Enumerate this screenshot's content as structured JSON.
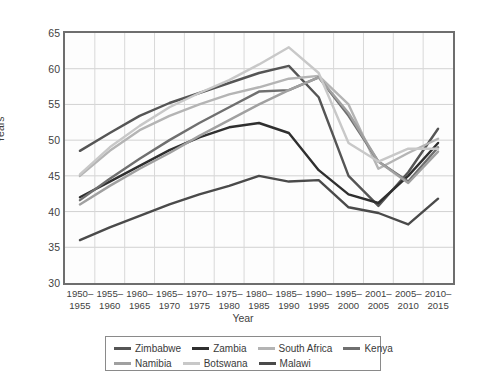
{
  "chart_data": {
    "type": "line",
    "title": "",
    "xlabel": "Year",
    "ylabel": "Years",
    "ylim": [
      30,
      65
    ],
    "yticks": [
      30,
      35,
      40,
      45,
      50,
      55,
      60,
      65
    ],
    "grid": true,
    "legend_position": "bottom",
    "categories": [
      "1950–1955",
      "1955–1960",
      "1960–1965",
      "1965–1970",
      "1970–1975",
      "1975–1980",
      "1980–1985",
      "1985–1990",
      "1990–1995",
      "1995–2000",
      "2001–2005",
      "2005–2010",
      "2010–2015"
    ],
    "category_lines": [
      [
        "1950–",
        "1955"
      ],
      [
        "1955–",
        "1960"
      ],
      [
        "1960–",
        "1965"
      ],
      [
        "1965–",
        "1970"
      ],
      [
        "1970–",
        "1975"
      ],
      [
        "1975–",
        "1980"
      ],
      [
        "1980–",
        "1985"
      ],
      [
        "1985–",
        "1990"
      ],
      [
        "1990–",
        "1995"
      ],
      [
        "1995–",
        "2000"
      ],
      [
        "2001–",
        "2005"
      ],
      [
        "2005–",
        "2010"
      ],
      [
        "2010–",
        "2015"
      ]
    ],
    "series": [
      {
        "name": "Zimbabwe",
        "color": "#555555",
        "values": [
          48.5,
          51.0,
          53.4,
          55.2,
          56.6,
          58.0,
          59.4,
          60.4,
          56.0,
          45.0,
          40.8,
          45.5,
          51.6
        ]
      },
      {
        "name": "Zambia",
        "color": "#2f2f2f",
        "values": [
          42.0,
          44.2,
          46.4,
          48.6,
          50.4,
          51.8,
          52.4,
          51.0,
          45.8,
          42.4,
          41.2,
          45.0,
          49.6
        ]
      },
      {
        "name": "South Africa",
        "color": "#b4b4b4",
        "values": [
          45.0,
          48.5,
          51.4,
          53.4,
          55.0,
          56.4,
          57.4,
          58.6,
          59.0,
          55.0,
          46.0,
          48.2,
          50.2
        ]
      },
      {
        "name": "Kenya",
        "color": "#6f6f6f",
        "values": [
          41.6,
          44.6,
          47.4,
          50.0,
          52.4,
          54.6,
          56.8,
          57.0,
          58.8,
          53.4,
          47.0,
          44.2,
          49.0
        ]
      },
      {
        "name": "Namibia",
        "color": "#a0a0a0",
        "values": [
          41.0,
          43.6,
          46.0,
          48.2,
          50.6,
          52.8,
          55.0,
          57.0,
          58.8,
          53.8,
          47.0,
          44.0,
          48.4
        ]
      },
      {
        "name": "Botswana",
        "color": "#c8c8c8",
        "values": [
          45.2,
          49.0,
          52.0,
          54.6,
          56.6,
          58.4,
          60.6,
          63.0,
          59.4,
          49.6,
          47.0,
          48.8,
          48.8
        ]
      },
      {
        "name": "Malawi",
        "color": "#4a4a4a",
        "values": [
          36.0,
          37.8,
          39.4,
          41.0,
          42.4,
          43.6,
          45.0,
          44.2,
          44.4,
          40.6,
          39.8,
          38.2,
          41.8
        ]
      }
    ]
  },
  "axes": {
    "y_title": "Years",
    "x_title": "Year"
  }
}
